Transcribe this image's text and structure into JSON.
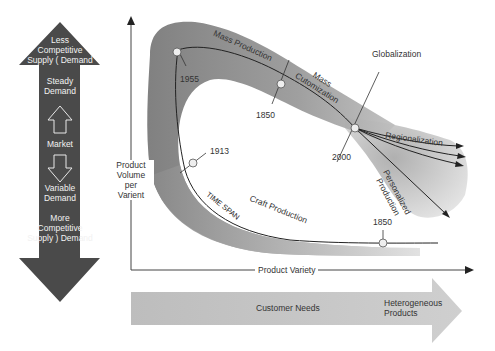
{
  "market_arrow": {
    "top_label": [
      "Less",
      "Competitive",
      "Supply ( Demand"
    ],
    "steady": [
      "Steady",
      "Demand"
    ],
    "middle": "Market",
    "variable": [
      "Variable",
      "Demand"
    ],
    "bottom_label": [
      "More",
      "Competitive",
      "Supply ) Demand"
    ],
    "color": "#4a4a4a"
  },
  "axes": {
    "y_label": [
      "Product",
      "Volume",
      "per",
      "Varient"
    ],
    "x_label": "Product Variety"
  },
  "curve_labels": {
    "mass_production": "Mass Production",
    "mass_customization": [
      "Mass",
      "Cutomization"
    ],
    "globalization": "Globalization",
    "regionalization": "Regionalization",
    "personalized_production": [
      "Personalized",
      "Production"
    ],
    "craft_production": "Craft Production",
    "time_span": "TIME SPAN"
  },
  "years": {
    "y1955": "1955",
    "y1850_mass": "1850",
    "y2000": "2000",
    "y1913": "1913",
    "y1850_craft": "1850"
  },
  "bottom_arrow": {
    "center": "Customer Needs",
    "right": [
      "Heterogeneous",
      "Products"
    ],
    "color": "#c4c4c4"
  }
}
